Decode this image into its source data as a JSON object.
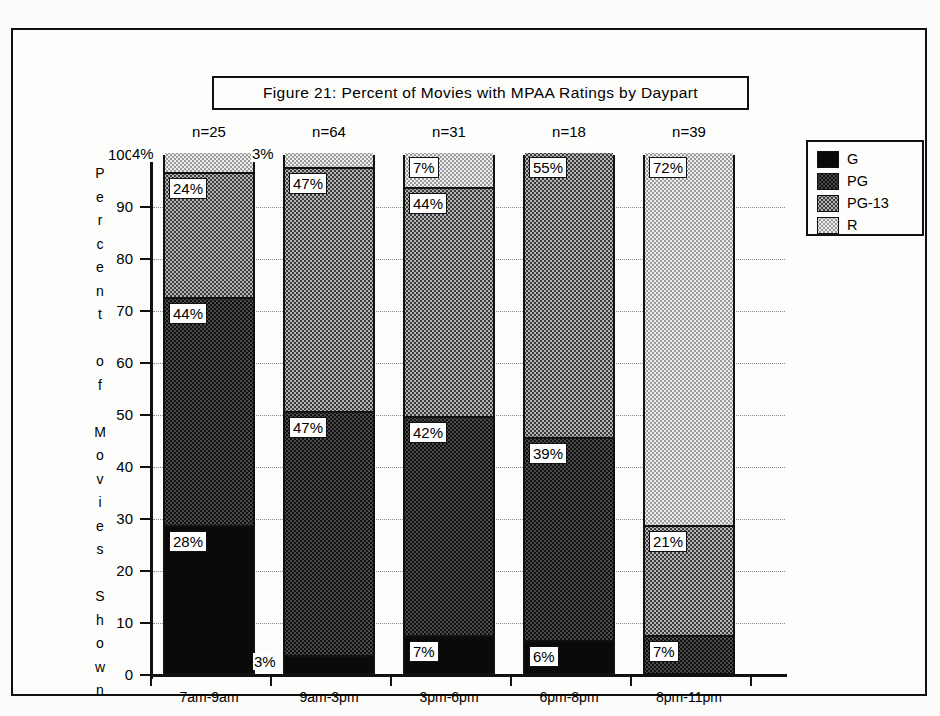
{
  "figure": {
    "title": "Figure 21:   Percent of Movies with MPAA Ratings by Daypart"
  },
  "axes": {
    "y_title_letters": [
      "P",
      "e",
      "r",
      "c",
      "e",
      "n",
      "t",
      "",
      "o",
      "f",
      "",
      "M",
      "o",
      "v",
      "i",
      "e",
      "s",
      "",
      "S",
      "h",
      "o",
      "w",
      "n"
    ],
    "y_title": "Percent of Movies Shown",
    "y_ticks": [
      "100",
      "90",
      "80",
      "70",
      "60",
      "50",
      "40",
      "30",
      "20",
      "10",
      "0"
    ]
  },
  "legend": {
    "items": [
      {
        "label": "G",
        "swatch": "solid-black-swatch"
      },
      {
        "label": "PG",
        "swatch": "dark-dither-swatch"
      },
      {
        "label": "PG-13",
        "swatch": "medium-dither-swatch"
      },
      {
        "label": "R",
        "swatch": "light-dither-swatch"
      }
    ]
  },
  "chart_data": {
    "type": "bar",
    "stacked": true,
    "title": "Figure 21:   Percent of Movies with MPAA Ratings by Daypart",
    "xlabel": "",
    "ylabel": "Percent of Movies Shown",
    "ylim": [
      0,
      100
    ],
    "ytick_step": 10,
    "grid": true,
    "legend_position": "right",
    "categories": [
      "7am-9am",
      "9am-3pm",
      "3pm-6pm",
      "6pm-8pm",
      "8pm-11pm"
    ],
    "sample_sizes": [
      "n=25",
      "n=64",
      "n=31",
      "n=18",
      "n=39"
    ],
    "series": [
      {
        "name": "G",
        "values": [
          28,
          3,
          7,
          6,
          0
        ]
      },
      {
        "name": "PG",
        "values": [
          44,
          47,
          42,
          39,
          7
        ]
      },
      {
        "name": "PG-13",
        "values": [
          24,
          47,
          44,
          55,
          21
        ]
      },
      {
        "name": "R",
        "values": [
          4,
          3,
          7,
          0,
          72
        ]
      }
    ],
    "bars": [
      {
        "category": "7am-9am",
        "n": "n=25",
        "segments": [
          {
            "rating": "G",
            "value": 28,
            "label": "28%",
            "label_position": "inside"
          },
          {
            "rating": "PG",
            "value": 44,
            "label": "44%",
            "label_position": "inside"
          },
          {
            "rating": "PG-13",
            "value": 24,
            "label": "24%",
            "label_position": "inside"
          },
          {
            "rating": "R",
            "value": 4,
            "label": "4%",
            "label_position": "outside-left"
          }
        ]
      },
      {
        "category": "9am-3pm",
        "n": "n=64",
        "segments": [
          {
            "rating": "G",
            "value": 3,
            "label": "3%",
            "label_position": "outside-left-bottom"
          },
          {
            "rating": "PG",
            "value": 47,
            "label": "47%",
            "label_position": "inside"
          },
          {
            "rating": "PG-13",
            "value": 47,
            "label": "47%",
            "label_position": "inside"
          },
          {
            "rating": "R",
            "value": 3,
            "label": "3%",
            "label_position": "outside-left"
          }
        ]
      },
      {
        "category": "3pm-6pm",
        "n": "n=31",
        "segments": [
          {
            "rating": "G",
            "value": 7,
            "label": "7%",
            "label_position": "inside"
          },
          {
            "rating": "PG",
            "value": 42,
            "label": "42%",
            "label_position": "inside"
          },
          {
            "rating": "PG-13",
            "value": 44,
            "label": "44%",
            "label_position": "inside"
          },
          {
            "rating": "R",
            "value": 7,
            "label": "7%",
            "label_position": "inside"
          }
        ]
      },
      {
        "category": "6pm-8pm",
        "n": "n=18",
        "segments": [
          {
            "rating": "G",
            "value": 6,
            "label": "6%",
            "label_position": "inside"
          },
          {
            "rating": "PG",
            "value": 39,
            "label": "39%",
            "label_position": "inside"
          },
          {
            "rating": "PG-13",
            "value": 55,
            "label": "55%",
            "label_position": "inside"
          },
          {
            "rating": "R",
            "value": 0,
            "label": "",
            "label_position": "none"
          }
        ]
      },
      {
        "category": "8pm-11pm",
        "n": "n=39",
        "segments": [
          {
            "rating": "G",
            "value": 0,
            "label": "",
            "label_position": "none"
          },
          {
            "rating": "PG",
            "value": 7,
            "label": "7%",
            "label_position": "inside"
          },
          {
            "rating": "PG-13",
            "value": 21,
            "label": "21%",
            "label_position": "inside"
          },
          {
            "rating": "R",
            "value": 72,
            "label": "72%",
            "label_position": "inside"
          }
        ]
      }
    ]
  }
}
